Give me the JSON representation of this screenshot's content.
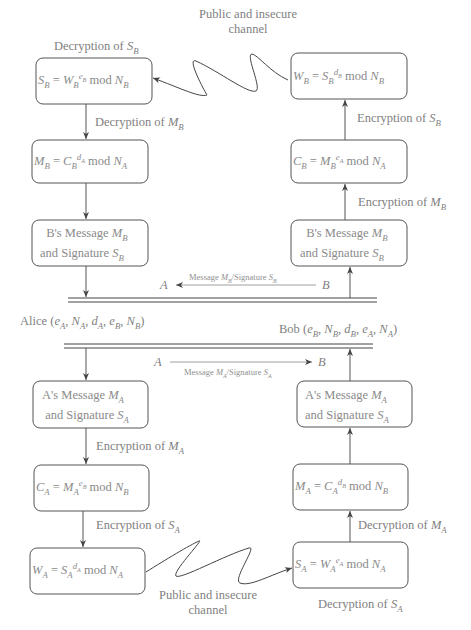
{
  "diagram": {
    "channel_label_top": [
      "Public and insecure",
      "channel"
    ],
    "channel_label_bottom": [
      "Public and insecure",
      "channel"
    ],
    "parties": {
      "alice": {
        "name": "Alice",
        "keys": "(eA, NA, dA, eB, NB)"
      },
      "bob": {
        "name": "Bob",
        "keys": "(eB, NB, dB, eA, NA)"
      }
    },
    "upper_flow": {
      "left_column": [
        {
          "id": "SB-decrypt",
          "formula": "SB = WB^eB mod NB",
          "label_above": "Decryption of SB"
        },
        {
          "id": "MB-decrypt",
          "formula": "MB = CB^dA mod NA",
          "edge_label": "Decryption of MB"
        },
        {
          "id": "B-msg-left",
          "lines": [
            "B's Message MB",
            "and Signature SB"
          ]
        }
      ],
      "right_column": [
        {
          "id": "WB-encrypt",
          "formula": "WB = SB^dB mod NB"
        },
        {
          "id": "CB-encrypt",
          "formula": "CB = MB^eA mod NA",
          "edge_label": "Encryption of SB"
        },
        {
          "id": "B-msg-right",
          "lines": [
            "B's Message MB",
            "and Signature SB"
          ],
          "edge_label": "Encryption of MB"
        }
      ],
      "transfer": {
        "from": "B",
        "to": "A",
        "label": "Message MB/Signature SB"
      }
    },
    "lower_flow": {
      "transfer": {
        "from": "A",
        "to": "B",
        "label": "Message MA/Signature SA"
      },
      "left_column": [
        {
          "id": "A-msg-left",
          "lines": [
            "A's Message MA",
            "and Signature SA"
          ]
        },
        {
          "id": "CA-encrypt",
          "formula": "CA = MA^eB mod NB",
          "edge_label": "Encryption of MA"
        },
        {
          "id": "WA-encrypt",
          "formula": "WA = SA^dA mod NA",
          "edge_label": "Encryption of SA"
        }
      ],
      "right_column": [
        {
          "id": "A-msg-right",
          "lines": [
            "A's Message MA",
            "and Signature SA"
          ]
        },
        {
          "id": "MA-decrypt",
          "formula": "MA = CA^dB mod NB"
        },
        {
          "id": "SA-decrypt",
          "formula": "SA = WA^eA mod NA",
          "edge_label": "Decryption of MA",
          "label_below": "Decryption of SA"
        }
      ]
    },
    "labels": {
      "dec_SB": "Decryption of",
      "dec_MB": "Decryption of",
      "enc_SB": "Encryption of",
      "enc_MB": "Encryption of",
      "enc_MA": "Encryption of",
      "enc_SA": "Encryption of",
      "dec_MA": "Decryption of",
      "dec_SA": "Decryption of",
      "bs_message": "B's Message",
      "as_message": "A's Message",
      "and_signature": "and Signature",
      "message": "Message",
      "signature": "/Signature",
      "mod": "mod",
      "alice": "Alice",
      "bob": "Bob",
      "A": "A",
      "B": "B"
    }
  }
}
